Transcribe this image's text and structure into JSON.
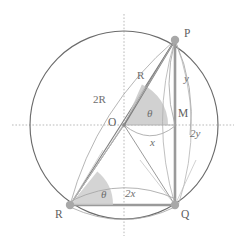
{
  "figure": {
    "type": "geometry-diagram",
    "canvas": {
      "width": 242,
      "height": 245,
      "background": "#ffffff"
    }
  },
  "colors": {
    "circle_stroke": "#6b6b6b",
    "chord_stroke": "#8c8c8c",
    "heavy_stroke": "#9a9a9a",
    "arc_stroke": "#a0a0a0",
    "axis_stroke": "#b9b9b9",
    "sector_fill": "#c9c9c9",
    "vertex_fill": "#a8a8a8",
    "label_text": "#6e6e6e"
  },
  "geometry": {
    "center": {
      "x": 124,
      "y": 125,
      "label": "O"
    },
    "radius": 94,
    "points": [
      {
        "name": "P",
        "x": 175,
        "y": 40,
        "label": "P"
      },
      {
        "name": "Q",
        "x": 175,
        "y": 205,
        "label": "Q"
      },
      {
        "name": "R",
        "x": 70,
        "y": 205,
        "label": "R"
      },
      {
        "name": "M",
        "x": 175,
        "y": 125,
        "label": "M"
      }
    ],
    "axes": {
      "horizontal_y": 125,
      "vertical_x": 124
    }
  },
  "labels": {
    "vertices": [
      {
        "key": "P",
        "text": "P",
        "x": 184,
        "y": 28
      },
      {
        "key": "O",
        "text": "O",
        "x": 108,
        "y": 117
      },
      {
        "key": "M",
        "text": "M",
        "x": 178,
        "y": 108
      },
      {
        "key": "Q",
        "text": "Q",
        "x": 181,
        "y": 209
      },
      {
        "key": "R",
        "text": "R",
        "x": 55,
        "y": 209
      }
    ],
    "measures": [
      {
        "key": "radius",
        "text": "R",
        "x": 137,
        "y": 70,
        "italic": false
      },
      {
        "key": "diameter",
        "text": "2R",
        "x": 93,
        "y": 94,
        "italic": false
      },
      {
        "key": "angle-center",
        "text": "θ",
        "x": 147,
        "y": 108,
        "italic": true
      },
      {
        "key": "angle-inscribed",
        "text": "θ",
        "x": 101,
        "y": 189,
        "italic": true
      },
      {
        "key": "arc-x",
        "text": "x",
        "x": 150,
        "y": 137,
        "italic": true
      },
      {
        "key": "arc-2x",
        "text": "2x",
        "x": 125,
        "y": 188,
        "italic": true
      },
      {
        "key": "arc-y",
        "text": "y",
        "x": 184,
        "y": 73,
        "italic": true
      },
      {
        "key": "arc-2y",
        "text": "2y",
        "x": 190,
        "y": 128,
        "italic": true
      }
    ]
  }
}
